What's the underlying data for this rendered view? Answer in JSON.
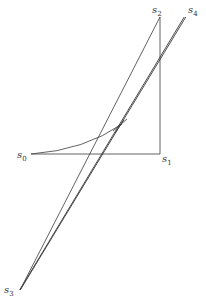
{
  "diagram": {
    "title": "",
    "stroke_color": "#3a3a3a",
    "background": "#ffffff",
    "points": [
      {
        "id": "s0",
        "base": "s",
        "sub": "0"
      },
      {
        "id": "s1",
        "base": "s",
        "sub": "1"
      },
      {
        "id": "s2",
        "base": "s",
        "sub": "2"
      },
      {
        "id": "s3",
        "base": "s",
        "sub": "3"
      },
      {
        "id": "s4",
        "base": "s",
        "sub": "4"
      }
    ],
    "edges": [
      {
        "from": "s0",
        "to": "s1",
        "type": "line"
      },
      {
        "from": "s1",
        "to": "s2",
        "type": "line"
      },
      {
        "from": "s2",
        "to": "s3",
        "type": "line"
      },
      {
        "from": "s4",
        "to": "s3",
        "type": "double-line"
      },
      {
        "from": "s0",
        "to": "crossing",
        "type": "curve"
      }
    ]
  }
}
